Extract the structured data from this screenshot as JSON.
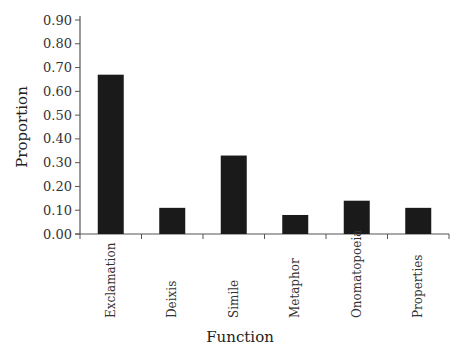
{
  "chart_data": {
    "type": "bar",
    "title": "",
    "xlabel": "Function",
    "ylabel": "Proportion",
    "categories": [
      "Exclamation",
      "Deixis",
      "Simile",
      "Metaphor",
      "Onomatopoeia",
      "Properties"
    ],
    "values": [
      0.67,
      0.11,
      0.33,
      0.08,
      0.14,
      0.11
    ],
    "ylim": [
      0,
      0.9
    ],
    "yticks": [
      "0.00",
      "0.10",
      "0.20",
      "0.30",
      "0.40",
      "0.50",
      "0.60",
      "0.70",
      "0.80",
      "0.90"
    ],
    "grid": false,
    "legend": null,
    "colors": {
      "bar": "#1a1a1a",
      "axis": "#555555"
    }
  }
}
